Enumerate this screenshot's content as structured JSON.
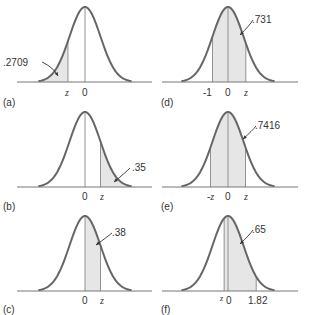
{
  "colors": {
    "curve": "#666666",
    "axis": "#777777",
    "shade": "#e6e6e6",
    "line": "#888888",
    "text": "#333333"
  },
  "panels": [
    {
      "id": "a",
      "caption": "(a)",
      "area_label": ".2709",
      "ticks": [
        "z",
        "0"
      ],
      "shade": "left tail below z"
    },
    {
      "id": "b",
      "caption": "(b)",
      "area_label": ".35",
      "ticks": [
        "0",
        "z"
      ],
      "shade": "right tail above z"
    },
    {
      "id": "c",
      "caption": "(c)",
      "area_label": ".38",
      "ticks": [
        "0",
        "z"
      ],
      "shade": "between 0 and z"
    },
    {
      "id": "d",
      "caption": "(d)",
      "area_label": ".731",
      "ticks": [
        "-1",
        "0",
        "z"
      ],
      "shade": "between -1 and z"
    },
    {
      "id": "e",
      "caption": "(e)",
      "area_label": ".7416",
      "ticks": [
        "-z",
        "0",
        "z"
      ],
      "shade": "between -z and z"
    },
    {
      "id": "f",
      "caption": "(f)",
      "area_label": ".65",
      "ticks": [
        "z",
        "0",
        "1.82"
      ],
      "shade": "between z and 1.82"
    }
  ]
}
